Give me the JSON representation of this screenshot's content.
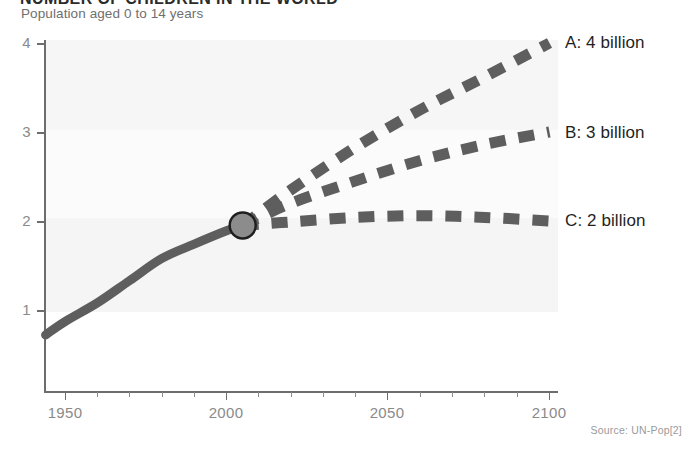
{
  "chart_data": {
    "type": "line",
    "title": "NUMBER OF CHILDREN IN THE WORLD",
    "subtitle": "Population aged 0 to 14 years",
    "xlabel": "",
    "ylabel": "",
    "xlim": [
      1944,
      2100
    ],
    "ylim": [
      0,
      4
    ],
    "grid": false,
    "x_ticks": [
      1950,
      2000,
      2050,
      2100
    ],
    "x_tick_labels": [
      "1950",
      "2000",
      "2050",
      "2100"
    ],
    "x_minor_tick_step": 10,
    "y_ticks": [
      1,
      2,
      3,
      4
    ],
    "y_tick_labels": [
      "1",
      "2",
      "3",
      "4"
    ],
    "legend_position": "right-inline",
    "annotations": [
      {
        "name": "present-marker",
        "x": 2005,
        "y": 1.95,
        "shape": "circle"
      }
    ],
    "source": "Source: UN-Pop[2]",
    "colors": {
      "line": "#5e5e5e",
      "marker_fill": "#8c8c8c",
      "marker_stroke": "#1f1f1f",
      "axis": "#6d6d6d",
      "band": "#f4f4f4",
      "tick_text": "#8a8a8a",
      "label_text": "#1f1f1f",
      "subtitle_text": "#6f6f6f",
      "source_text": "#9a9a9a"
    },
    "series": [
      {
        "name": "Historical",
        "style": "solid",
        "label": "",
        "x": [
          1944,
          1950,
          1960,
          1970,
          1980,
          1990,
          2000,
          2005
        ],
        "values": [
          0.72,
          0.87,
          1.08,
          1.33,
          1.58,
          1.74,
          1.89,
          1.95
        ]
      },
      {
        "name": "A",
        "label": "A: 4 billion",
        "style": "dashed",
        "x": [
          2005,
          2020,
          2040,
          2060,
          2080,
          2100
        ],
        "values": [
          1.95,
          2.35,
          2.83,
          3.25,
          3.62,
          4.0
        ]
      },
      {
        "name": "B",
        "label": "B: 3 billion",
        "style": "dashed",
        "x": [
          2005,
          2020,
          2040,
          2060,
          2080,
          2100
        ],
        "values": [
          1.95,
          2.2,
          2.45,
          2.68,
          2.86,
          3.0
        ]
      },
      {
        "name": "C",
        "label": "C: 2 billion",
        "style": "dashed",
        "x": [
          2005,
          2020,
          2040,
          2060,
          2080,
          2100
        ],
        "values": [
          1.95,
          1.99,
          2.04,
          2.06,
          2.04,
          2.0
        ]
      }
    ]
  },
  "labels": {
    "y_1": "1",
    "y_2": "2",
    "y_3": "3",
    "y_4": "4",
    "x_1950": "1950",
    "x_2000": "2000",
    "x_2050": "2050",
    "x_2100": "2100",
    "series_a": "A: 4 billion",
    "series_b": "B: 3 billion",
    "series_c": "C: 2 billion"
  }
}
